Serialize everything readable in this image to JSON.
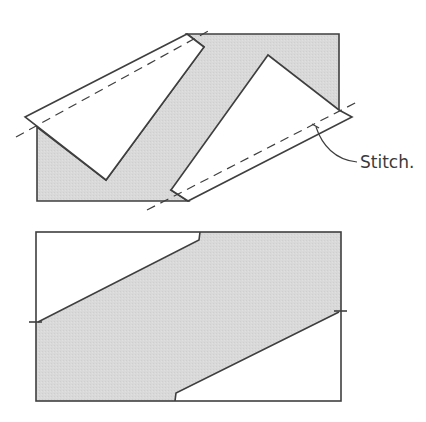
{
  "colors": {
    "background": "#ffffff",
    "fabric_fill": "#d9d9d9",
    "stroke": "#3f3f3f",
    "flap_fill": "#ffffff"
  },
  "diagram_top": {
    "fabric_polygon": "37,127 106,180 204,47 187,34 339,34 339,110 171,190 188,201 37,201",
    "left_flap_polygon": "25,117 187,34 204,47 106,180",
    "right_flap_polygon": "171,190 268,55 339,110 352,117 188,201",
    "stitch_line_left": {
      "x1": 16,
      "y1": 137,
      "x2": 212,
      "y2": 29
    },
    "stitch_line_right": {
      "x1": 147,
      "y1": 210,
      "x2": 359,
      "y2": 101
    },
    "stitch_tick": {
      "x1": 313,
      "y1": 125,
      "x2": 318,
      "y2": 127
    },
    "leader_path": "M316,127 C322,145 335,160 357,162",
    "label": {
      "text": "Stitch.",
      "x": 360,
      "y": 168
    }
  },
  "diagram_bottom": {
    "rect": {
      "x": 36,
      "y": 232,
      "width": 305,
      "height": 169
    },
    "fabric_polygon": "38,322 199,240 200,232 341,232 341,312 339,312 176,393 175,401 36,401 36,322",
    "cut_line_upper": "38,322 199,240 200,232",
    "cut_line_lower": "339,312 176,393 175,401",
    "tick_left": {
      "x1": 29,
      "y1": 322,
      "x2": 42,
      "y2": 322
    },
    "tick_right": {
      "x1": 334,
      "y1": 311,
      "x2": 347,
      "y2": 311
    }
  }
}
